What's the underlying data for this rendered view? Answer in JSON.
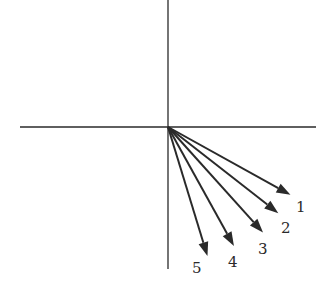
{
  "diagram": {
    "type": "vector-fan",
    "axes": {
      "horizontal": true,
      "vertical": true
    },
    "vectors": [
      {
        "label": "1",
        "angle_below_horizontal_deg": 29
      },
      {
        "label": "2",
        "angle_below_horizontal_deg": 38
      },
      {
        "label": "3",
        "angle_below_horizontal_deg": 48
      },
      {
        "label": "4",
        "angle_below_horizontal_deg": 61
      },
      {
        "label": "5",
        "angle_below_horizontal_deg": 73
      }
    ],
    "color": "#2a2a2a"
  }
}
